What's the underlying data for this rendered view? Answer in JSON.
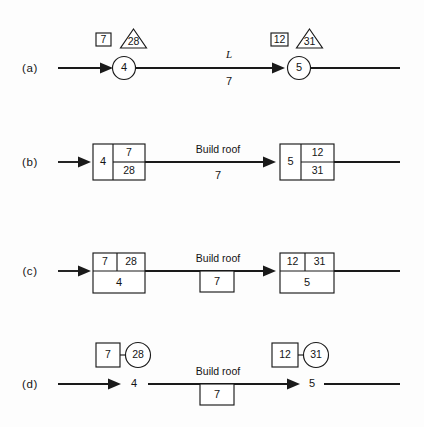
{
  "figure": {
    "background_color": "#fdfdfd",
    "ink_color": "#1a1a1a",
    "width": 424,
    "height": 427
  },
  "rows": [
    {
      "id": "a",
      "label": "(a)",
      "notation": "circle-node with square and triangle event times",
      "left_node": {
        "node_number": "4",
        "square_value": "7",
        "triangle_value": "28"
      },
      "right_node": {
        "node_number": "5",
        "square_value": "12",
        "triangle_value": "31"
      },
      "activity": {
        "name": "L",
        "name_style": "italic",
        "duration": "7"
      }
    },
    {
      "id": "b",
      "label": "(b)",
      "notation": "rectangle with node number left, early time top-right, late time bottom-right",
      "left_node": {
        "node_number": "4",
        "top_value": "7",
        "bottom_value": "28"
      },
      "right_node": {
        "node_number": "5",
        "top_value": "12",
        "bottom_value": "31"
      },
      "activity": {
        "name": "Build roof",
        "duration": "7"
      }
    },
    {
      "id": "c",
      "label": "(c)",
      "notation": "rectangle with two times on top row and node number on bottom row, duration boxed below line",
      "left_node": {
        "node_number": "4",
        "top_left_value": "7",
        "top_right_value": "28"
      },
      "right_node": {
        "node_number": "5",
        "top_left_value": "12",
        "top_right_value": "31"
      },
      "activity": {
        "name": "Build roof",
        "duration": "7"
      }
    },
    {
      "id": "d",
      "label": "(d)",
      "notation": "bare node number on line, square and circle event times above, duration boxed below line",
      "left_node": {
        "node_number": "4",
        "square_value": "7",
        "circle_value": "28"
      },
      "right_node": {
        "node_number": "5",
        "square_value": "12",
        "circle_value": "31"
      },
      "activity": {
        "name": "Build roof",
        "duration": "7"
      }
    }
  ]
}
